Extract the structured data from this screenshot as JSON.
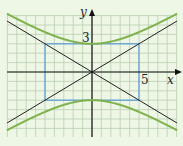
{
  "diagram": {
    "type": "hyperbola",
    "equation": "y^2/9 - x^2/25 = 1",
    "labels": {
      "y_axis": "y",
      "x_axis": "x",
      "b_value": "3",
      "a_value": "5"
    },
    "colors": {
      "background": "#eef6e6",
      "grid": "#b9cfb0",
      "curve": "#7fb24a",
      "rectangle": "#5b9bd5",
      "asymptote": "#222222",
      "axis": "#111111"
    },
    "a": 5,
    "b": 3,
    "grid_unit_px": 9.4,
    "origin_px": [
      92,
      72
    ]
  }
}
